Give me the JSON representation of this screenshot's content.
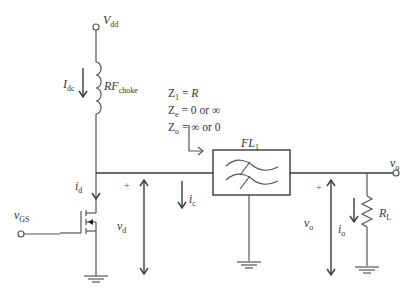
{
  "diagram": {
    "type": "circuit-schematic",
    "nodes": {
      "supply": {
        "label": "V",
        "sub": "dd"
      },
      "input": {
        "label": "v",
        "sub": "GS"
      },
      "output": {
        "label": "v",
        "sub": "o"
      }
    },
    "components": {
      "choke": {
        "label": "RF",
        "sub": "choke"
      },
      "filter": {
        "label": "FL",
        "sub": "1"
      },
      "load": {
        "label": "R",
        "sub": "L"
      },
      "transistor": {
        "type": "n-channel MOSFET"
      }
    },
    "currents": {
      "idc": {
        "label": "I",
        "sub": "dc"
      },
      "id": {
        "label": "i",
        "sub": "d"
      },
      "ic": {
        "label": "i",
        "sub": "c"
      },
      "io": {
        "label": "i",
        "sub": "o"
      }
    },
    "voltages": {
      "vd": {
        "label": "v",
        "sub": "d",
        "polarity": "+"
      },
      "vo": {
        "label": "v",
        "sub": "o",
        "polarity": "+"
      }
    },
    "impedance_annotation": [
      {
        "lhs": "Z",
        "sub": "1",
        "rhs": "= ",
        "value": "R"
      },
      {
        "lhs": "Z",
        "sub": "e",
        "rhs": "= 0 or ∞"
      },
      {
        "lhs": "Z",
        "sub": "o",
        "rhs": "= ∞ or 0"
      }
    ],
    "colors": {
      "wire": "#555555",
      "text": "#333333",
      "background": "#ffffff"
    }
  }
}
